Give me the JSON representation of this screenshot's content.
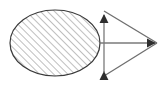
{
  "figure": {
    "width": 166,
    "height": 85,
    "background_color": "#ffffff",
    "stroke_color": "#3a3a3a",
    "hatch_color": "#8a8a8a",
    "line_color": "#777777",
    "shapes": {
      "ellipse": {
        "name": "hatched-ellipse",
        "center_x": 55,
        "center_y": 43,
        "radius_x": 45,
        "radius_y": 33,
        "fill": "none",
        "fill_pattern": "diagonal-hatch",
        "hatch_angle_degrees": 45,
        "hatch_spacing_px": 5,
        "stroke_width": 1.2
      },
      "triangle": {
        "name": "arrow-triangle",
        "apex_top_x": 104,
        "apex_top_y": 10,
        "apex_bottom_x": 104,
        "apex_bottom_y": 77,
        "apex_right_x": 158,
        "apex_right_y": 43,
        "stroke_width": 1.2
      },
      "vertical_axis": {
        "name": "vertical-double-arrow",
        "x": 104,
        "y_top": 10,
        "y_bottom": 77,
        "arrowhead_top": true,
        "arrowhead_bottom": true
      },
      "horizontal_axis": {
        "name": "horizontal-arrow",
        "y": 43,
        "x_start": 100,
        "x_end": 158,
        "arrowhead_right": true
      },
      "diagonals": [
        {
          "name": "upper-diagonal",
          "x1": 104,
          "y1": 10,
          "x2": 158,
          "y2": 43
        },
        {
          "name": "lower-diagonal",
          "x1": 104,
          "y1": 77,
          "x2": 158,
          "y2": 43
        }
      ]
    },
    "labels": []
  }
}
